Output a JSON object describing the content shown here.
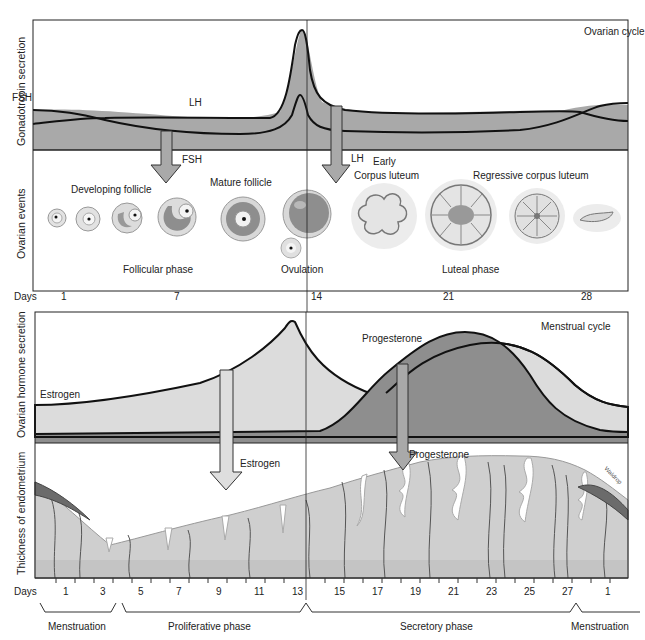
{
  "colors": {
    "dark_fill": "#8e8e8e",
    "mid_fill": "#a9a9a9",
    "light_fill": "#dcdcdc",
    "endometrium": "#cfcfcf",
    "vessels": "#555555",
    "blood": "#6b6b6b",
    "line": "#111111"
  },
  "top_panel": {
    "title": "Ovarian cycle",
    "ylabel_gonadotropin": "Gonadotropin secretion",
    "ylabel_events": "Ovarian events",
    "curve_labels": {
      "fsh": "FSH",
      "lh": "LH"
    },
    "arrow_labels": {
      "fsh": "FSH",
      "lh": "LH"
    },
    "stage_labels": {
      "developing": "Developing follicle",
      "mature": "Mature follicle",
      "early_cl_1": "Early",
      "early_cl_2": "Corpus luteum",
      "regressive": "Regressive corpus luteum"
    },
    "phase_labels": {
      "follicular": "Follicular phase",
      "ovulation": "Ovulation",
      "luteal": "Luteal phase"
    },
    "days_label": "Days",
    "days": [
      "1",
      "7",
      "14",
      "21",
      "28"
    ]
  },
  "bottom_panel": {
    "title": "Menstrual cycle",
    "ylabel_hormone": "Ovarian hormone secretion",
    "ylabel_endometrium": "Thickness of endometrium",
    "curve_labels": {
      "estrogen": "Estrogen",
      "progesterone": "Progesterone"
    },
    "arrow_labels": {
      "estrogen": "Estrogen",
      "progesterone": "Progesterone"
    },
    "signature": "Waldrop",
    "days_label": "Days",
    "days": [
      "1",
      "3",
      "5",
      "7",
      "9",
      "11",
      "13",
      "15",
      "17",
      "19",
      "21",
      "23",
      "25",
      "27",
      "1"
    ],
    "phases": [
      "Menstruation",
      "Proliferative phase",
      "Secretory phase",
      "Menstruation"
    ]
  }
}
